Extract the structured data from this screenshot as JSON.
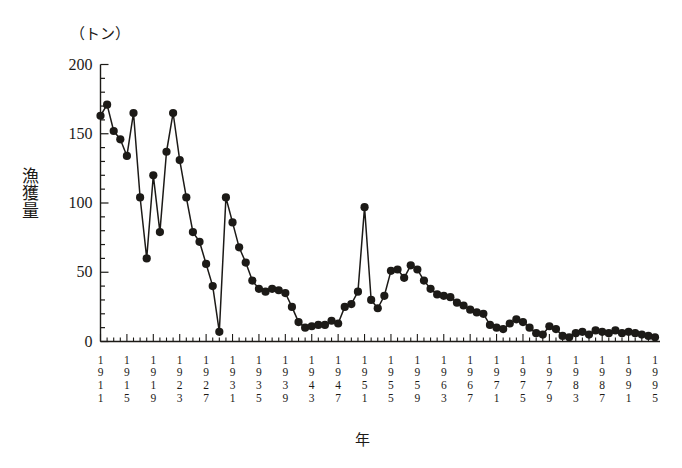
{
  "chart_data": {
    "type": "line",
    "title": "",
    "unit_label": "（トン）",
    "ylabel": "漁獲量",
    "xlabel": "年",
    "ylim": [
      0,
      200
    ],
    "xlim": [
      1911,
      1995
    ],
    "yticks": [
      0,
      50,
      100,
      150,
      200
    ],
    "ytick_labels": [
      "0",
      "50",
      "100",
      "150",
      "200"
    ],
    "y_minor_tick_step": 10,
    "x_minor_tick_step": 1,
    "x_major_tick_step": 4,
    "grid": false,
    "legend": null,
    "marker": "filled-circle",
    "line_color": "#1c1a17",
    "marker_color": "#1c1a17",
    "xtick_labels": [
      "1911",
      "1915",
      "1919",
      "1923",
      "1927",
      "1931",
      "1935",
      "1939",
      "1943",
      "1947",
      "1951",
      "1955",
      "1959",
      "1963",
      "1967",
      "1971",
      "1975",
      "1979",
      "1983",
      "1987",
      "1991",
      "1995"
    ],
    "x": [
      1911,
      1912,
      1913,
      1914,
      1915,
      1916,
      1917,
      1918,
      1919,
      1920,
      1921,
      1922,
      1923,
      1924,
      1925,
      1926,
      1927,
      1928,
      1929,
      1930,
      1931,
      1932,
      1933,
      1934,
      1935,
      1936,
      1937,
      1938,
      1939,
      1940,
      1941,
      1942,
      1943,
      1944,
      1945,
      1946,
      1947,
      1948,
      1949,
      1950,
      1951,
      1952,
      1953,
      1954,
      1955,
      1956,
      1957,
      1958,
      1959,
      1960,
      1961,
      1962,
      1963,
      1964,
      1965,
      1966,
      1967,
      1968,
      1969,
      1970,
      1971,
      1972,
      1973,
      1974,
      1975,
      1976,
      1977,
      1978,
      1979,
      1980,
      1981,
      1982,
      1983,
      1984,
      1985,
      1986,
      1987,
      1988,
      1989,
      1990,
      1991,
      1992,
      1993,
      1994,
      1995
    ],
    "values": [
      163,
      171,
      152,
      146,
      134,
      165,
      104,
      60,
      120,
      79,
      137,
      165,
      131,
      104,
      79,
      72,
      56,
      40,
      7,
      104,
      86,
      68,
      57,
      44,
      38,
      36,
      38,
      37,
      35,
      25,
      14,
      10,
      11,
      12,
      12,
      15,
      13,
      25,
      27,
      36,
      97,
      30,
      24,
      33,
      51,
      52,
      46,
      55,
      52,
      44,
      38,
      34,
      33,
      32,
      28,
      26,
      23,
      21,
      20,
      12,
      10,
      9,
      13,
      16,
      14,
      10,
      6,
      5,
      11,
      9,
      4,
      3,
      6,
      7,
      5,
      8,
      7,
      6,
      8,
      6,
      7,
      6,
      5,
      4,
      3
    ],
    "series_name": "漁獲量"
  }
}
